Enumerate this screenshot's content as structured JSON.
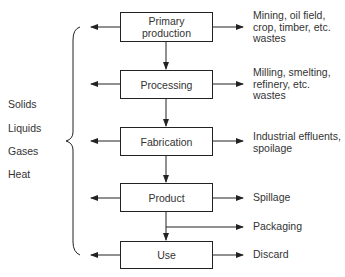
{
  "stages": [
    {
      "label": "Primary\nproduction",
      "output": "Mining, oil field,\ncrop, timber, etc.\nwastes"
    },
    {
      "label": "Processing",
      "output": "Milling, smelting,\nrefinery, etc.\nwastes"
    },
    {
      "label": "Fabrication",
      "output": "Industrial effluents,\nspoilage"
    },
    {
      "label": "Product",
      "output": "Spillage"
    },
    {
      "label": "Use",
      "output": "Discard"
    }
  ],
  "branch_output": "Packaging",
  "waste_types": [
    "Solids",
    "Liquids",
    "Gases",
    "Heat"
  ]
}
